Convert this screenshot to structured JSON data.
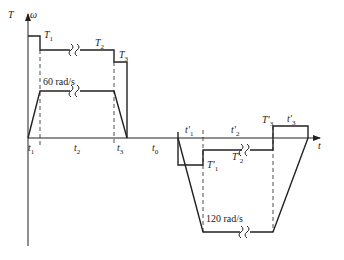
{
  "diagram": {
    "type": "torque-speed timing diagram",
    "axes": {
      "vertical_label_T": "T",
      "vertical_label_omega": "ω",
      "horizontal_label": "t"
    },
    "forward": {
      "speed_label": "60 rad/s",
      "torque_labels": [
        "T",
        "T",
        "T"
      ],
      "torque_subs": [
        "1",
        "2",
        "3"
      ],
      "time_labels": [
        "t",
        "t",
        "t"
      ],
      "time_subs": [
        "1",
        "2",
        "3"
      ]
    },
    "pause": {
      "label": "t",
      "sub": "0"
    },
    "reverse": {
      "speed_label": "120 rad/s",
      "torque_labels": [
        "T′",
        "T′",
        "T′"
      ],
      "torque_subs": [
        "1",
        "2",
        "3"
      ],
      "time_labels": [
        "t′",
        "t′",
        "t′"
      ],
      "time_subs": [
        "1",
        "2",
        "3"
      ]
    },
    "colors": {
      "line": "#222222",
      "background": "#ffffff"
    }
  }
}
